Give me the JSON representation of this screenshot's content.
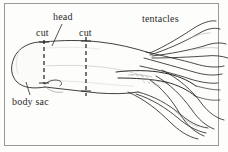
{
  "figure": {
    "domain": "Diagram",
    "background_color": "#fdfdfc",
    "ink_color": "#2b2b2b",
    "frame_color": "#9a9a96"
  },
  "labels": {
    "head": "head",
    "cut_anterior": "cut",
    "cut_posterior": "cut",
    "tentacles": "tentacles",
    "body_sac": "body sac"
  },
  "annotations": {
    "cut_lines": [
      {
        "name": "cut-line-anterior",
        "x": 44,
        "y_top": 40,
        "y_bottom": 84,
        "style": "dashed"
      },
      {
        "name": "cut-line-posterior",
        "x": 86,
        "y_top": 37,
        "y_bottom": 96,
        "style": "dashed"
      }
    ],
    "leader_lines": [
      {
        "name": "head-leader",
        "from_x": 62,
        "from_y": 24,
        "to_x": 52,
        "to_y": 46
      },
      {
        "name": "body-sac-leader",
        "from_x": 30,
        "from_y": 95,
        "to_x": 26,
        "to_y": 82
      }
    ]
  },
  "parts": {
    "body_sac": "rounded bulb at left end of mantle",
    "mantle": "tapering tube body",
    "tentacles": "eight arms and two long feeding tentacles fanning right"
  }
}
